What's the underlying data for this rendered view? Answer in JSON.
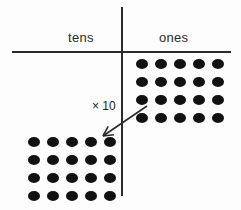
{
  "diagram": {
    "background_color": "#fdfdfd",
    "ink_color": "#2b2b2b",
    "dot_color": "#111111",
    "columns": [
      {
        "key": "tens",
        "label": "tens",
        "dot_count": 20,
        "dot_rows": 4,
        "dot_columns": 5
      },
      {
        "key": "ones",
        "label": "ones",
        "dot_count": 20,
        "dot_rows": 4,
        "dot_columns": 5
      }
    ],
    "annotation": {
      "label": "× 10",
      "arrow_name": "times-ten-arrow",
      "arrow_from": "ones",
      "arrow_to": "tens",
      "arrow_start_x": 147,
      "arrow_start_y": 106,
      "arrow_end_x": 103,
      "arrow_end_y": 136
    },
    "rules": {
      "horizontal_y": 51,
      "vertical_x": 121
    }
  }
}
